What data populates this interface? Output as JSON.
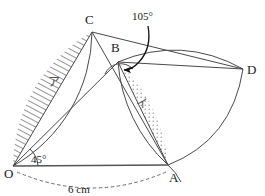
{
  "figure": {
    "type": "geometry-diagram",
    "background": "#ffffff",
    "line_color": "#4a4a4a"
  },
  "points": {
    "O": {
      "label": "O",
      "x": 13,
      "y": 166,
      "label_x": 4,
      "label_y": 176
    },
    "A": {
      "label": "A",
      "x": 168,
      "y": 165,
      "label_x": 169,
      "label_y": 181
    },
    "B": {
      "label": "B",
      "x": 118,
      "y": 62,
      "label_x": 112,
      "label_y": 51
    },
    "C": {
      "label": "C",
      "x": 92,
      "y": 32,
      "label_x": 86,
      "label_y": 23
    },
    "D": {
      "label": "D",
      "x": 243,
      "y": 69,
      "label_x": 247,
      "label_y": 72
    }
  },
  "angles": [
    {
      "name": "angle-at-O",
      "value": "45°",
      "label_x": 38,
      "label_y": 162
    },
    {
      "name": "angle-at-B",
      "value": "105°",
      "label_x": 137,
      "label_y": 18
    }
  ],
  "measurements": [
    {
      "name": "segment-OA-length",
      "value": "6 cm",
      "label_x": 78,
      "label_y": 193
    }
  ],
  "regions": [
    {
      "name": "region-hatched",
      "label": "ア",
      "fill": "hatch",
      "label_x": 53,
      "label_y": 82
    },
    {
      "name": "region-dotted",
      "label": "イ",
      "fill": "dots",
      "label_x": 140,
      "label_y": 104
    }
  ],
  "colors": {
    "stroke": "#4a4a4a",
    "label": "#1a1a1a",
    "region_label": "#555555",
    "dash": "#6a6a6a"
  }
}
